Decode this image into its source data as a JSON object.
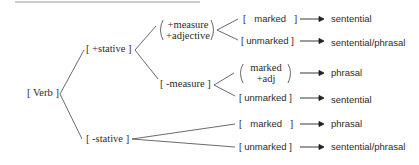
{
  "diagram": {
    "root": "[ Verb ]",
    "level1": {
      "stative": "[ +stative ]",
      "nonstative": "[ -stative ]"
    },
    "level2": {
      "measure_adj_line1": "+measure",
      "measure_adj_line2": "+adjective",
      "nonmeasure": "[ -measure ]"
    },
    "leaves": [
      {
        "label": "[ marked ]",
        "result": "sentential"
      },
      {
        "label": "[ unmarked ]",
        "result": "sentential/phrasal"
      },
      {
        "label_line1": "marked",
        "label_line2": "+adj",
        "result": "phrasal"
      },
      {
        "label": "[ unmarked ]",
        "result": "sentential"
      },
      {
        "label": "[ marked ]",
        "result": "phrasal"
      },
      {
        "label": "[ unmarked ]",
        "result": "sentential/phrasal"
      }
    ],
    "arrow_icon": "right-arrow"
  }
}
